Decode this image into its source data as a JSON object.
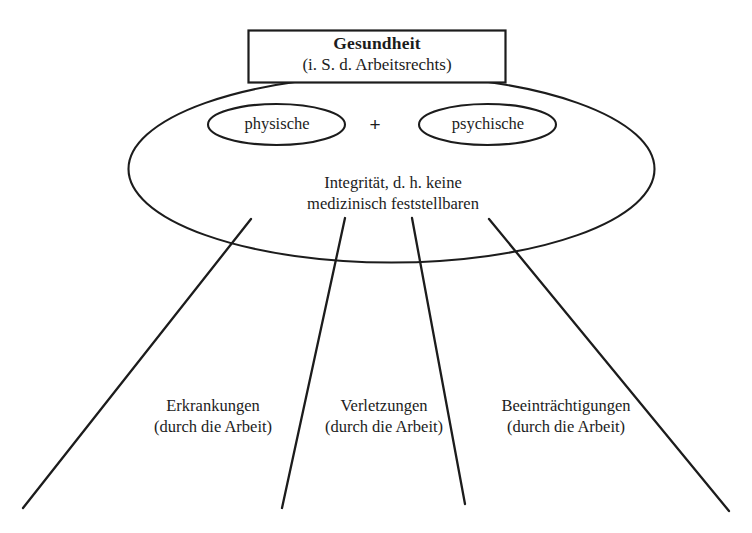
{
  "diagram": {
    "type": "concept-diagram",
    "language": "de",
    "title_box": {
      "heading": "Gesundheit",
      "subheading": "(i. S. d. Arbeitsrechts)"
    },
    "components": {
      "left_ellipse_label": "physische",
      "operator": "+",
      "right_ellipse_label": "psychische"
    },
    "definition": {
      "line1": "Integrität, d. h. keine",
      "line2": "medizinisch feststellbaren"
    },
    "categories": [
      {
        "name": "Erkrankungen",
        "qualifier": "(durch die Arbeit)"
      },
      {
        "name": "Verletzungen",
        "qualifier": "(durch die Arbeit)"
      },
      {
        "name": "Beeinträchtigungen",
        "qualifier": "(durch die Arbeit)"
      }
    ],
    "colors": {
      "stroke": "#1c1c1c",
      "text": "#1c1c1c",
      "background": "#ffffff"
    }
  }
}
